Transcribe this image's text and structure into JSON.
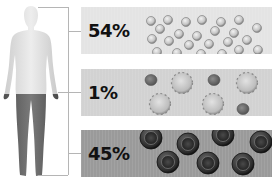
{
  "colors": {
    "plasma_panel": "#e4e4e4",
    "wbc_panel": "#d2d2d2",
    "rbc_panel": "#9a9a9a",
    "bracket": "#b5b5b5",
    "text": "#111111"
  },
  "figure": {
    "label": "human-body-silhouette"
  },
  "panels": [
    {
      "id": "plasma",
      "percent": "54%",
      "cells": "plasma-droplets"
    },
    {
      "id": "white-cells-platelets",
      "percent": "1%",
      "cells": "white-blood-cells-and-platelets"
    },
    {
      "id": "red-cells",
      "percent": "45%",
      "cells": "red-blood-cells"
    }
  ]
}
